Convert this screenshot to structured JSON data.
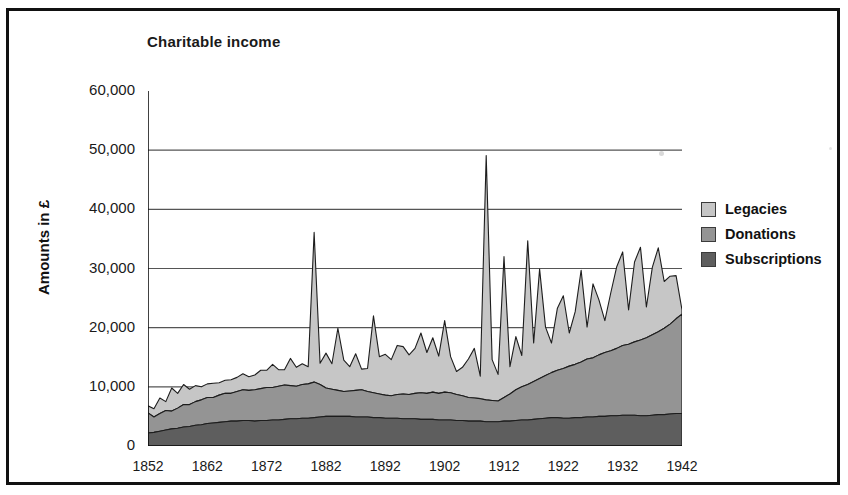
{
  "chart_title": "Charitable income",
  "y_axis_title": "Amounts in £",
  "legend": [
    {
      "label": "Legacies",
      "color": "#c6c6c6"
    },
    {
      "label": "Donations",
      "color": "#949494"
    },
    {
      "label": "Subscriptions",
      "color": "#5e5e5e"
    }
  ],
  "y_ticks": [
    "0",
    "10,000",
    "20,000",
    "30,000",
    "40,000",
    "50,000",
    "60,000"
  ],
  "x_ticks": [
    "1852",
    "1862",
    "1872",
    "1882",
    "1892",
    "1902",
    "1912",
    "1922",
    "1932",
    "1942"
  ],
  "chart_data": {
    "type": "area",
    "stacked": true,
    "title": "Charitable income",
    "xlabel": "",
    "ylabel": "Amounts in £",
    "ylim": [
      0,
      60000
    ],
    "xlim": [
      1852,
      1942
    ],
    "grid": true,
    "legend_position": "right",
    "x": [
      1852,
      1853,
      1854,
      1855,
      1856,
      1857,
      1858,
      1859,
      1860,
      1861,
      1862,
      1863,
      1864,
      1865,
      1866,
      1867,
      1868,
      1869,
      1870,
      1871,
      1872,
      1873,
      1874,
      1875,
      1876,
      1877,
      1878,
      1879,
      1880,
      1881,
      1882,
      1883,
      1884,
      1885,
      1886,
      1887,
      1888,
      1889,
      1890,
      1891,
      1892,
      1893,
      1894,
      1895,
      1896,
      1897,
      1898,
      1899,
      1900,
      1901,
      1902,
      1903,
      1904,
      1905,
      1906,
      1907,
      1908,
      1909,
      1910,
      1911,
      1912,
      1913,
      1914,
      1915,
      1916,
      1917,
      1918,
      1919,
      1920,
      1921,
      1922,
      1923,
      1924,
      1925,
      1926,
      1927,
      1928,
      1929,
      1930,
      1931,
      1932,
      1933,
      1934,
      1935,
      1936,
      1937,
      1938,
      1939,
      1940,
      1941,
      1942
    ],
    "series": [
      {
        "name": "Subscriptions",
        "color": "#5e5e5e",
        "values": [
          2200,
          2300,
          2500,
          2700,
          2900,
          3000,
          3200,
          3300,
          3500,
          3600,
          3800,
          3900,
          4000,
          4100,
          4200,
          4200,
          4300,
          4300,
          4200,
          4300,
          4300,
          4400,
          4400,
          4500,
          4600,
          4600,
          4700,
          4700,
          4800,
          4900,
          5000,
          5000,
          5000,
          5000,
          5000,
          4900,
          4900,
          4900,
          4800,
          4800,
          4700,
          4700,
          4700,
          4600,
          4600,
          4600,
          4500,
          4500,
          4500,
          4400,
          4400,
          4400,
          4300,
          4300,
          4200,
          4200,
          4200,
          4100,
          4100,
          4100,
          4200,
          4200,
          4300,
          4400,
          4400,
          4500,
          4600,
          4700,
          4800,
          4800,
          4700,
          4700,
          4800,
          4800,
          4900,
          4900,
          5000,
          5000,
          5100,
          5100,
          5200,
          5200,
          5200,
          5100,
          5100,
          5200,
          5300,
          5300,
          5400,
          5500,
          5500
        ]
      },
      {
        "name": "Donations",
        "color": "#949494",
        "values": [
          3400,
          2600,
          3000,
          3300,
          3000,
          3400,
          3800,
          3700,
          4000,
          4200,
          4400,
          4300,
          4600,
          4800,
          4700,
          5000,
          5200,
          5100,
          5300,
          5400,
          5600,
          5500,
          5700,
          5800,
          5600,
          5500,
          5700,
          5800,
          6000,
          5500,
          4800,
          4600,
          4400,
          4200,
          4300,
          4500,
          4600,
          4300,
          4200,
          4000,
          3900,
          3800,
          4000,
          4200,
          4100,
          4300,
          4500,
          4400,
          4600,
          4500,
          4700,
          4600,
          4400,
          4200,
          4000,
          3900,
          3800,
          3700,
          3600,
          3500,
          4000,
          4600,
          5200,
          5600,
          6000,
          6400,
          6800,
          7200,
          7600,
          8000,
          8400,
          8800,
          9000,
          9400,
          9800,
          10000,
          10400,
          10800,
          11000,
          11400,
          11800,
          12000,
          12400,
          12800,
          13200,
          13600,
          14000,
          14600,
          15200,
          16000,
          16800
        ]
      },
      {
        "name": "Legacies",
        "color": "#c6c6c6",
        "values": [
          1200,
          1400,
          2600,
          1500,
          3900,
          2500,
          3400,
          2600,
          2700,
          2200,
          2300,
          2400,
          2100,
          2200,
          2300,
          2400,
          2700,
          2300,
          2500,
          3100,
          2900,
          3900,
          2800,
          2600,
          4600,
          3200,
          3500,
          2900,
          25300,
          3600,
          5900,
          4300,
          10500,
          5300,
          4100,
          6200,
          3500,
          3900,
          13000,
          6300,
          6900,
          6100,
          8300,
          8000,
          6700,
          7600,
          10100,
          6900,
          9200,
          6300,
          12100,
          6100,
          3900,
          4800,
          6500,
          8400,
          3800,
          41300,
          6900,
          4500,
          23800,
          4600,
          9000,
          5300,
          24300,
          6500,
          18500,
          8200,
          5000,
          10500,
          12300,
          5600,
          8900,
          15500,
          5400,
          12500,
          9300,
          5400,
          9800,
          13800,
          15800,
          5800,
          13500,
          15700,
          5200,
          11400,
          14200,
          7900,
          8100,
          7300,
          700
        ]
      }
    ]
  }
}
